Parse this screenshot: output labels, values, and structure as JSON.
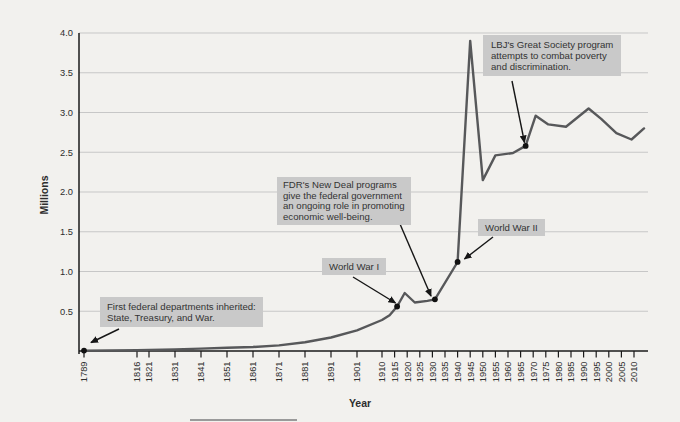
{
  "chart_data": {
    "type": "line",
    "xlabel": "Year",
    "ylabel": "Millions",
    "ylim": [
      0,
      4.0
    ],
    "grid": "horizontal",
    "y_ticks": [
      0.5,
      1.0,
      1.5,
      2.0,
      2.5,
      3.0,
      3.5,
      4.0
    ],
    "x_ticks": [
      1789,
      1816,
      1821,
      1831,
      1841,
      1851,
      1861,
      1871,
      1881,
      1891,
      1901,
      1910,
      1915,
      1920,
      1925,
      1930,
      1935,
      1940,
      1945,
      1950,
      1955,
      1960,
      1965,
      1970,
      1975,
      1980,
      1985,
      1990,
      1995,
      2000,
      2005,
      2010
    ],
    "series": [
      {
        "points": [
          [
            1789,
            0.005
          ],
          [
            1816,
            0.01
          ],
          [
            1831,
            0.02
          ],
          [
            1841,
            0.03
          ],
          [
            1851,
            0.04
          ],
          [
            1861,
            0.05
          ],
          [
            1871,
            0.07
          ],
          [
            1881,
            0.11
          ],
          [
            1891,
            0.17
          ],
          [
            1901,
            0.26
          ],
          [
            1910,
            0.39
          ],
          [
            1913,
            0.45
          ],
          [
            1916,
            0.56
          ],
          [
            1919,
            0.73
          ],
          [
            1923,
            0.61
          ],
          [
            1928,
            0.63
          ],
          [
            1931,
            0.65
          ],
          [
            1940,
            1.12
          ],
          [
            1945,
            3.9
          ],
          [
            1950,
            2.15
          ],
          [
            1955,
            2.46
          ],
          [
            1962,
            2.49
          ],
          [
            1967,
            2.58
          ],
          [
            1971,
            2.96
          ],
          [
            1976,
            2.85
          ],
          [
            1983,
            2.82
          ],
          [
            1992,
            3.05
          ],
          [
            1997,
            2.92
          ],
          [
            2003,
            2.74
          ],
          [
            2009,
            2.66
          ],
          [
            2014,
            2.8
          ]
        ]
      }
    ],
    "markers": [
      {
        "year": 1789,
        "value": 0.005
      },
      {
        "year": 1916,
        "value": 0.56
      },
      {
        "year": 1931,
        "value": 0.65
      },
      {
        "year": 1940,
        "value": 1.12
      },
      {
        "year": 1967,
        "value": 2.58
      }
    ]
  },
  "annotations": {
    "first_departments": {
      "lines": [
        "First federal departments inherited:",
        "State, Treasury, and War."
      ]
    },
    "world_war_1": {
      "label": "World War I"
    },
    "fdr_new_deal": {
      "lines": [
        "FDR's New Deal programs",
        "give the federal government",
        "an ongoing role in promoting",
        "economic well-being."
      ]
    },
    "world_war_2": {
      "label": "World War II"
    },
    "lbj_great_society": {
      "lines": [
        "LBJ's Great Society program",
        "attempts to combat poverty",
        "and discrimination."
      ]
    }
  },
  "colors": {
    "background": "#f2f1ee",
    "line": "#57585a",
    "gridline": "#c7c7c7",
    "axis": "#1a1a1a",
    "annotation_box": "#c9c9c9",
    "marker_dot": "#111111",
    "text": "#2d2d2d"
  }
}
